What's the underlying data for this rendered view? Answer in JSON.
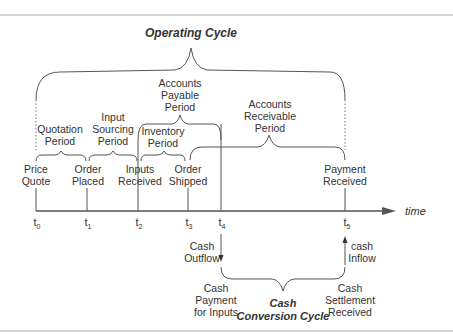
{
  "title": "Operating Cycle",
  "periods": {
    "accounts_payable": [
      "Accounts",
      "Payable",
      "Period"
    ],
    "accounts_receivable": [
      "Accounts",
      "Receivable",
      "Period"
    ],
    "quotation": [
      "Quotation",
      "Period"
    ],
    "input_sourcing": [
      "Input",
      "Sourcing",
      "Period"
    ],
    "inventory": [
      "Inventory",
      "Period"
    ]
  },
  "events": [
    {
      "lines": [
        "Price",
        "Quote"
      ],
      "tick": "t",
      "sub": "0"
    },
    {
      "lines": [
        "Order",
        "Placed"
      ],
      "tick": "t",
      "sub": "1"
    },
    {
      "lines": [
        "Inputs",
        "Received"
      ],
      "tick": "t",
      "sub": "2"
    },
    {
      "lines": [
        "Order",
        "Shipped"
      ],
      "tick": "t",
      "sub": "3"
    },
    {
      "lines": [
        "",
        ""
      ],
      "tick": "t",
      "sub": "4"
    },
    {
      "lines": [
        "Payment",
        "Received"
      ],
      "tick": "t",
      "sub": "5"
    }
  ],
  "axis_label": "time",
  "cash_outflow": [
    "Cash",
    "Outflow"
  ],
  "cash_inflow": [
    "cash",
    "Inflow"
  ],
  "cash_payment": [
    "Cash",
    "Payment",
    "for Inputs"
  ],
  "cash_settlement": [
    "Cash",
    "Settlement",
    "Received"
  ],
  "cash_conversion": [
    "Cash",
    "Conversion Cycle"
  ],
  "colors": {
    "line": "#555555",
    "text": "#333333",
    "rule": "#999999"
  }
}
